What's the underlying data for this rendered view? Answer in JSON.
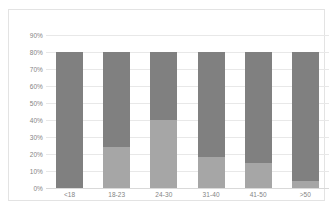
{
  "chart_data": {
    "type": "bar",
    "subtype": "stacked-bar",
    "title": "",
    "subtitle": "",
    "xlabel": "",
    "ylabel": "",
    "categories": [
      "<18",
      "18-23",
      "24-30",
      "31-40",
      "41-50",
      ">50"
    ],
    "series": [
      {
        "name": "lower-segment",
        "color": "#a6a6a6",
        "values": [
          0,
          24,
          40,
          18,
          15,
          4
        ]
      },
      {
        "name": "upper-segment",
        "color": "#808080",
        "values": [
          80,
          56,
          40,
          62,
          65,
          76
        ]
      }
    ],
    "totals": [
      80,
      80,
      80,
      80,
      80,
      80
    ],
    "ylim": [
      0,
      90
    ],
    "ytick_values": [
      90,
      80,
      70,
      60,
      50,
      40,
      30,
      20,
      10,
      0
    ],
    "ytick_labels": [
      "90%",
      "80%",
      "70%",
      "60%",
      "50%",
      "40%",
      "30%",
      "20%",
      "10%",
      "0%"
    ],
    "grid": true,
    "legend": false,
    "legend_position": "none",
    "annotations": []
  },
  "colors": {
    "segment_upper": "#808080",
    "segment_lower": "#a6a6a6",
    "gridline": "#e8e8e8",
    "axis_text": "#848484",
    "plot_border": "#e3e3e3",
    "background": "#ffffff"
  }
}
